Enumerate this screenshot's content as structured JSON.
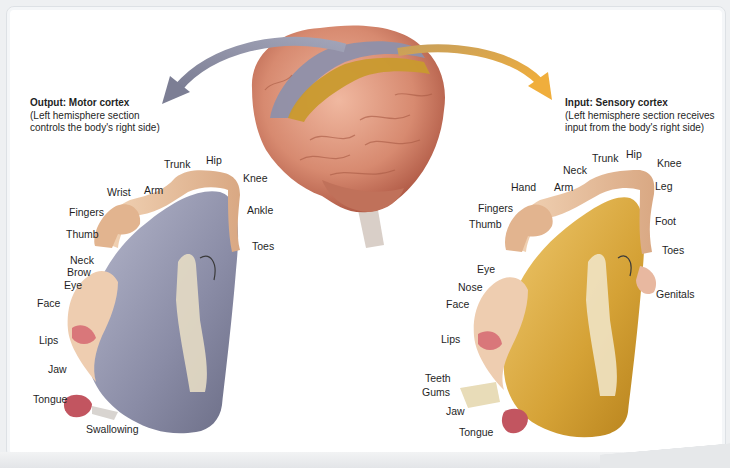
{
  "motor": {
    "title": "Output: Motor cortex",
    "subtitle_line1": "(Left hemisphere section",
    "subtitle_line2": "controls the body's right side)",
    "color": "#8c8fa6",
    "labels": {
      "trunk": "Trunk",
      "hip": "Hip",
      "knee": "Knee",
      "wrist": "Wrist",
      "arm": "Arm",
      "ankle": "Ankle",
      "fingers": "Fingers",
      "thumb": "Thumb",
      "toes": "Toes",
      "neck": "Neck",
      "brow": "Brow",
      "eye": "Eye",
      "face": "Face",
      "lips": "Lips",
      "jaw": "Jaw",
      "tongue": "Tongue",
      "swallowing": "Swallowing"
    }
  },
  "sensory": {
    "title": "Input: Sensory cortex",
    "subtitle_line1": "(Left hemisphere section receives",
    "subtitle_line2": "input from the body's right side)",
    "color": "#d4a02a",
    "labels": {
      "trunk": "Trunk",
      "hip": "Hip",
      "neck": "Neck",
      "knee": "Knee",
      "hand": "Hand",
      "arm": "Arm",
      "leg": "Leg",
      "fingers": "Fingers",
      "thumb": "Thumb",
      "foot": "Foot",
      "toes": "Toes",
      "eye": "Eye",
      "nose": "Nose",
      "face": "Face",
      "genitals": "Genitals",
      "lips": "Lips",
      "teeth": "Teeth",
      "gums": "Gums",
      "jaw": "Jaw",
      "tongue": "Tongue"
    }
  },
  "colors": {
    "brain": "#d98c72",
    "motor_strip": "#8e90aa",
    "sensory_strip": "#c99a2e",
    "skin": "#e9c3a0",
    "motor_arrow": "#86889c",
    "sensory_arrow": "#e0a640"
  }
}
